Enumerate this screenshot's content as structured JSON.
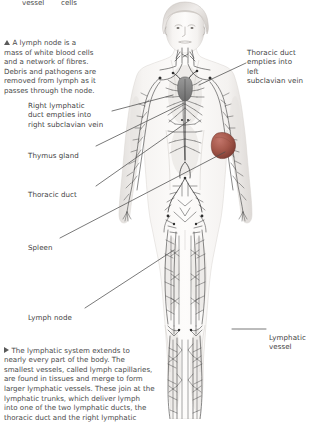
{
  "page": {
    "background_color": "#ffffff",
    "text_color": "#4a4a4a",
    "line_color": "#4c4c4c"
  },
  "top_caption_row": {
    "word_1": "vessel",
    "word_2": "cells"
  },
  "captions": [
    {
      "id": "lymph-node-caption",
      "marker": "up-triangle",
      "text": "A lymph node is a\nmass of white blood cells\nand a network of fibres.\nDebris and pathogens are\nremoved from lymph as it\npasses through the node."
    },
    {
      "id": "lymphatic-system-caption",
      "marker": "right-triangle",
      "text": "The lymphatic system extends to\nnearly every part of the body. The\nsmallest vessels, called lymph capillaries,\nare found in tissues and merge to form\nlarger lymphatic vessels. These join at the\nlymphatic trunks, which deliver lymph\ninto one of the two lymphatic ducts, the\nthoracic duct and the right lymphatic"
    }
  ],
  "labels": {
    "left": [
      {
        "id": "right-lymphatic-duct",
        "text": "Right lymphatic\nduct empties into\nright subclavian vein"
      },
      {
        "id": "thymus-gland",
        "text": "Thymus gland"
      },
      {
        "id": "thoracic-duct",
        "text": "Thoracic duct"
      },
      {
        "id": "spleen",
        "text": "Spleen"
      },
      {
        "id": "lymph-node",
        "text": "Lymph node"
      }
    ],
    "right": [
      {
        "id": "thoracic-duct-left-subclavian",
        "text": "Thoracic duct\nempties into left\nsubclavian vein"
      },
      {
        "id": "lymphatic-vessel",
        "text": "Lymphatic\nvessel"
      }
    ]
  },
  "figure": {
    "name": "human-body-lymphatic-system",
    "skin_color": "#f2f0ee",
    "vessel_color": "#3c3c3c",
    "spleen_color": "#a4574a",
    "thymus_color": "#8e8e8e"
  }
}
